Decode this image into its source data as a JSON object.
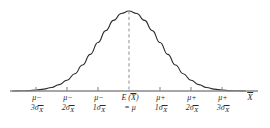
{
  "chart_data": {
    "type": "line",
    "title": "",
    "subtitle": "",
    "xlabel": "X̄",
    "ylabel": "",
    "grid": false,
    "legend": null,
    "curve": "normal probability density, mean = mu, standard error = sigma sub X-bar",
    "xlim": [
      -3.75,
      4.25
    ],
    "ylim": [
      0,
      1.08
    ],
    "mean": 0,
    "peak_value": 1.0,
    "x": [
      -3.75,
      -3.5,
      -3.25,
      -3.0,
      -2.75,
      -2.5,
      -2.25,
      -2.0,
      -1.75,
      -1.5,
      -1.25,
      -1.0,
      -0.75,
      -0.5,
      -0.25,
      0.0,
      0.25,
      0.5,
      0.75,
      1.0,
      1.25,
      1.5,
      1.75,
      2.0,
      2.25,
      2.5,
      2.75,
      3.0,
      3.25,
      3.5,
      3.75
    ],
    "values": [
      0.0009,
      0.0022,
      0.0051,
      0.0111,
      0.0229,
      0.0439,
      0.0796,
      0.1353,
      0.2163,
      0.3247,
      0.4578,
      0.6065,
      0.7548,
      0.8825,
      0.9692,
      1.0,
      0.9692,
      0.8825,
      0.7548,
      0.6065,
      0.4578,
      0.3247,
      0.2163,
      0.1353,
      0.0796,
      0.0439,
      0.0229,
      0.0111,
      0.0051,
      0.0022,
      0.0009
    ],
    "center_line": {
      "x": 0,
      "style": "dashed",
      "label": "mean"
    },
    "ticks": [
      {
        "x": -3,
        "line1": "μ−",
        "line2_coef": "3σ",
        "line2_sub": "X̄"
      },
      {
        "x": -2,
        "line1": "μ−",
        "line2_coef": "2σ",
        "line2_sub": "X̄"
      },
      {
        "x": -1,
        "line1": "μ−",
        "line2_coef": "1σ",
        "line2_sub": "X̄"
      },
      {
        "x": 0,
        "line1": "E (X̄)",
        "line2_coef": "= μ",
        "line2_sub": ""
      },
      {
        "x": 1,
        "line1": "μ+",
        "line2_coef": "1σ",
        "line2_sub": "X̄"
      },
      {
        "x": 2,
        "line1": "μ+",
        "line2_coef": "2σ",
        "line2_sub": "X̄"
      },
      {
        "x": 3,
        "line1": "μ+",
        "line2_coef": "3σ",
        "line2_sub": "X̄"
      }
    ],
    "colors": {
      "curve": "#2b2b2b",
      "axis": "#8a8a8a",
      "tick": "#8a8a8a",
      "dashed": "#9a9a9a",
      "text": "#2b2b2b",
      "background": "#ffffff"
    }
  },
  "labels": {
    "tick_0": {
      "line1": "μ−",
      "coef": "3σ",
      "sub": "X̄"
    },
    "tick_1": {
      "line1": "μ−",
      "coef": "2σ",
      "sub": "X̄"
    },
    "tick_2": {
      "line1": "μ−",
      "coef": "1σ",
      "sub": "X̄"
    },
    "tick_3": {
      "line1": "E (X̄)",
      "coef": "= μ",
      "sub": ""
    },
    "tick_4": {
      "line1": "μ+",
      "coef": "1σ",
      "sub": "X̄"
    },
    "tick_5": {
      "line1": "μ+",
      "coef": "2σ",
      "sub": "X̄"
    },
    "tick_6": {
      "line1": "μ+",
      "coef": "3σ",
      "sub": "X̄"
    },
    "axis_title": "X̄"
  }
}
